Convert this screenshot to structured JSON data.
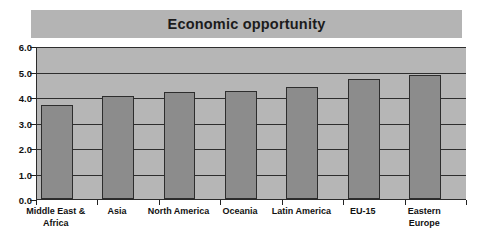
{
  "chart_data": {
    "type": "bar",
    "title": "Economic opportunity",
    "xlabel": "",
    "ylabel": "",
    "ylim": [
      0,
      6
    ],
    "ytick_step": 1,
    "ytick_labels": [
      "0.0",
      "1.0",
      "2.0",
      "3.0",
      "4.0",
      "5.0",
      "6.0"
    ],
    "ytick_values": [
      0,
      1,
      2,
      3,
      4,
      5,
      6
    ],
    "grid": true,
    "grid_axis": "y",
    "legend": false,
    "legend_position": "none",
    "categories": [
      "Middle East &\nAfrica",
      "Asia",
      "North America",
      "Oceania",
      "Latin America",
      "EU-15",
      "Eastern\nEurope"
    ],
    "values": [
      3.7,
      4.05,
      4.2,
      4.25,
      4.4,
      4.7,
      4.85
    ],
    "bar_color": "#8c8c8c",
    "bar_border_color": "#2d2d2d",
    "plot_background": "#b6b6b6",
    "title_banner_color": "#b4b4b4",
    "axis_color": "#2b2b2b",
    "page_background": "#ffffff"
  }
}
